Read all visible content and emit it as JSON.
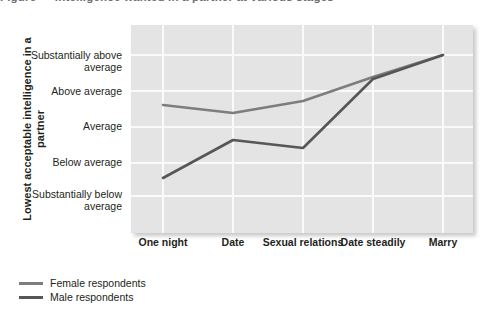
{
  "title": {
    "text": "Figure — Intelligence wanted in a partner at various stages"
  },
  "axis": {
    "y_title": "Lowest acceptable intelligence in a partner",
    "y_ticks": [
      {
        "label": "Substantially above average",
        "value": 5,
        "y": 56
      },
      {
        "label": "Above average",
        "value": 4,
        "y": 92
      },
      {
        "label": "Average",
        "value": 3,
        "y": 127
      },
      {
        "label": "Below average",
        "value": 2,
        "y": 163
      },
      {
        "label": "Substantially below average",
        "value": 1,
        "y": 196
      }
    ],
    "x_ticks": [
      {
        "label": "One night",
        "x": 163
      },
      {
        "label": "Date",
        "x": 233
      },
      {
        "label": "Sexual relations",
        "x": 303
      },
      {
        "label": "Date steadily",
        "x": 373
      },
      {
        "label": "Marry",
        "x": 443
      }
    ]
  },
  "legend": {
    "position": "below-left",
    "entries": [
      {
        "label": "Female respondents",
        "color": "#7d7d7d"
      },
      {
        "label": "Male respondents",
        "color": "#565656"
      }
    ]
  },
  "colors": {
    "panel": "#e4e4e4",
    "gridline": "#fafafa",
    "female_line": "#7d7d7d",
    "male_line": "#565656",
    "text": "#231f20"
  },
  "chart_data": {
    "type": "line",
    "xlabel": "",
    "ylabel": "Lowest acceptable intelligence in a partner",
    "categories": [
      "One night",
      "Date",
      "Sexual relations",
      "Date steadily",
      "Marry"
    ],
    "ytick_labels": [
      "Substantially below average",
      "Below average",
      "Average",
      "Above average",
      "Substantially above average"
    ],
    "ylim": [
      1,
      5
    ],
    "grid": true,
    "legend_position": "below-left",
    "series": [
      {
        "name": "Female respondents",
        "color": "#7d7d7d",
        "values": [
          3.6,
          3.4,
          3.75,
          4.4,
          5.05
        ],
        "points_px": [
          {
            "x": 163,
            "y": 105
          },
          {
            "x": 233,
            "y": 113
          },
          {
            "x": 303,
            "y": 101
          },
          {
            "x": 373,
            "y": 77
          },
          {
            "x": 443,
            "y": 55
          }
        ]
      },
      {
        "name": "Male respondents",
        "color": "#565656",
        "values": [
          1.55,
          2.3,
          2.1,
          4.35,
          5.05
        ],
        "points_px": [
          {
            "x": 163,
            "y": 178
          },
          {
            "x": 233,
            "y": 140
          },
          {
            "x": 303,
            "y": 148
          },
          {
            "x": 373,
            "y": 79
          },
          {
            "x": 443,
            "y": 55
          }
        ]
      }
    ]
  }
}
